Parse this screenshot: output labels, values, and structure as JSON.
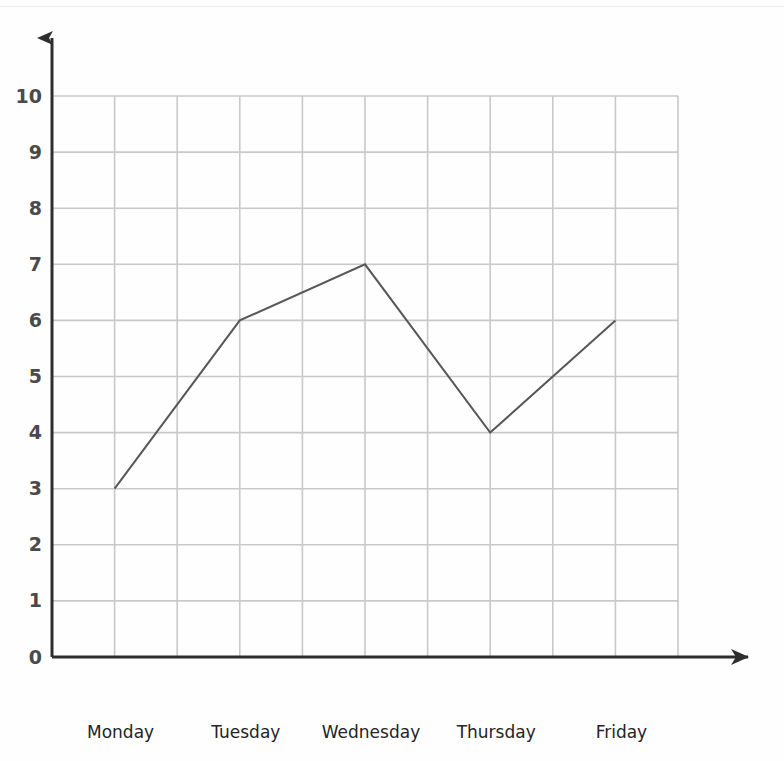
{
  "chart_data": {
    "type": "line",
    "title": "",
    "subtitle": "",
    "xlabel": "",
    "ylabel": "",
    "categories": [
      "Monday",
      "Tuesday",
      "Wednesday",
      "Thursday",
      "Friday"
    ],
    "values": [
      3,
      6,
      7,
      4,
      6
    ],
    "series": [
      {
        "name": "",
        "values": [
          3,
          6,
          7,
          4,
          6
        ]
      }
    ],
    "ylim": [
      0,
      10
    ],
    "y_ticks": [
      0,
      1,
      2,
      3,
      4,
      5,
      6,
      7,
      8,
      9,
      10
    ],
    "y_tick_labels": [
      "0",
      "1",
      "2",
      "3",
      "4",
      "5",
      "6",
      "7",
      "8",
      "9",
      "10"
    ],
    "x_tick_labels": [
      "Monday",
      "Tuesday",
      "Wednesday",
      "Thursday",
      "Friday"
    ],
    "grid": true,
    "grid_columns": 10,
    "grid_rows": 10,
    "legend": null,
    "legend_position": "none",
    "annotations": [],
    "colors": {
      "line": "#575757",
      "grid": "#c9c9c9",
      "axis": "#2e2e2e",
      "y_label_text": "#4a4a4a",
      "x_label_text": "#242424",
      "background": "#fefefe"
    },
    "axis_style": {
      "x_axis_arrow": true,
      "y_axis_arrow": true,
      "line_width": 2
    }
  }
}
